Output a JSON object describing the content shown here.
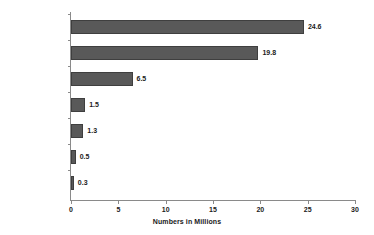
{
  "chart_data": {
    "type": "bar",
    "orientation": "horizontal",
    "title": "",
    "xlabel": "Numbers in Millions",
    "ylabel": "",
    "categories": [
      "Illicit Drugs",
      "Marijuana",
      "Prescription Drugs",
      "Cocaine",
      "Hallucinogens",
      "Inhalants",
      "Heroin"
    ],
    "values": [
      24.6,
      19.8,
      6.5,
      1.5,
      1.3,
      0.5,
      0.3
    ],
    "value_labels": [
      "24.6",
      "19.8",
      "6.5",
      "1.5",
      "1.3",
      "0.5",
      "0.3"
    ],
    "xlim": [
      0,
      30
    ],
    "xticks": [
      0,
      5,
      10,
      15,
      20,
      25,
      30
    ],
    "xtick_labels": [
      "0",
      "5",
      "10",
      "15",
      "20",
      "25",
      "30"
    ],
    "grid": false,
    "legend": null,
    "bar_color": "#595959",
    "bar_border_color": "#3f3f3f",
    "axis_color": "#8a8a8a",
    "text_color": "#1a1a1a",
    "background": "#ffffff"
  }
}
